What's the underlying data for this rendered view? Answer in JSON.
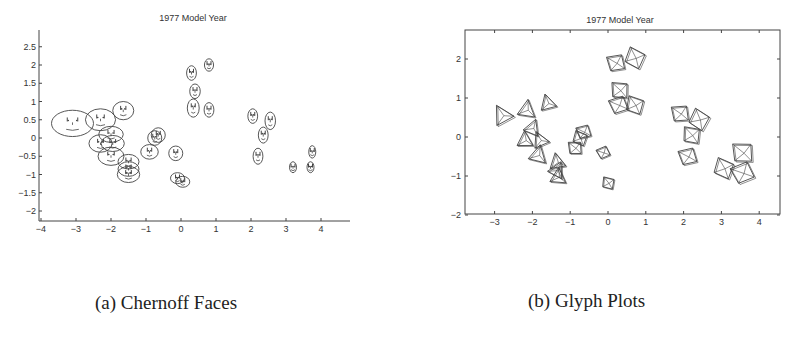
{
  "figure": {
    "captions": {
      "a": "(a) Chernoff Faces",
      "b": "(b) Glyph Plots"
    }
  },
  "chart_data": [
    {
      "type": "scatter",
      "glyph": "chernoff-face",
      "title": "1977 Model Year",
      "caption": "(a) Chernoff Faces",
      "xlabel": "",
      "ylabel": "",
      "xlim": [
        -4,
        4.8
      ],
      "ylim": [
        -2.3,
        3.0
      ],
      "xticks": [
        -4,
        -3,
        -2,
        -1,
        0,
        1,
        2,
        3,
        4
      ],
      "yticks": [
        2.5,
        2,
        1.5,
        1,
        0.5,
        0,
        -0.5,
        -1,
        -1.5,
        -2
      ],
      "grid": false,
      "box": false,
      "points": [
        {
          "x": -3.1,
          "y": 0.4,
          "w": 0.6,
          "h": 0.36
        },
        {
          "x": -2.3,
          "y": 0.5,
          "w": 0.43,
          "h": 0.3
        },
        {
          "x": -1.65,
          "y": 0.75,
          "w": 0.3,
          "h": 0.25
        },
        {
          "x": -2.0,
          "y": 0.1,
          "w": 0.35,
          "h": 0.22
        },
        {
          "x": -2.3,
          "y": -0.15,
          "w": 0.33,
          "h": 0.24
        },
        {
          "x": -1.95,
          "y": -0.15,
          "w": 0.33,
          "h": 0.22
        },
        {
          "x": -2.0,
          "y": -0.5,
          "w": 0.37,
          "h": 0.25
        },
        {
          "x": -1.5,
          "y": -0.65,
          "w": 0.3,
          "h": 0.2
        },
        {
          "x": -1.5,
          "y": -0.85,
          "w": 0.3,
          "h": 0.2
        },
        {
          "x": -1.5,
          "y": -1.0,
          "w": 0.32,
          "h": 0.22
        },
        {
          "x": -0.65,
          "y": 0.08,
          "w": 0.2,
          "h": 0.2
        },
        {
          "x": -0.75,
          "y": 0.0,
          "w": 0.2,
          "h": 0.2
        },
        {
          "x": -0.9,
          "y": -0.38,
          "w": 0.25,
          "h": 0.2
        },
        {
          "x": -0.15,
          "y": -0.42,
          "w": 0.2,
          "h": 0.2
        },
        {
          "x": -0.1,
          "y": -1.1,
          "w": 0.2,
          "h": 0.15
        },
        {
          "x": 0.05,
          "y": -1.2,
          "w": 0.2,
          "h": 0.15
        },
        {
          "x": 0.3,
          "y": 1.78,
          "w": 0.14,
          "h": 0.2
        },
        {
          "x": 0.8,
          "y": 2.0,
          "w": 0.13,
          "h": 0.17
        },
        {
          "x": 0.4,
          "y": 1.28,
          "w": 0.15,
          "h": 0.2
        },
        {
          "x": 0.35,
          "y": 0.82,
          "w": 0.17,
          "h": 0.25
        },
        {
          "x": 0.8,
          "y": 0.77,
          "w": 0.14,
          "h": 0.2
        },
        {
          "x": 2.05,
          "y": 0.6,
          "w": 0.14,
          "h": 0.2
        },
        {
          "x": 2.55,
          "y": 0.47,
          "w": 0.15,
          "h": 0.24
        },
        {
          "x": 2.35,
          "y": 0.08,
          "w": 0.14,
          "h": 0.22
        },
        {
          "x": 2.2,
          "y": -0.5,
          "w": 0.14,
          "h": 0.22
        },
        {
          "x": 3.2,
          "y": -0.8,
          "w": 0.1,
          "h": 0.15
        },
        {
          "x": 3.75,
          "y": -0.38,
          "w": 0.1,
          "h": 0.17
        },
        {
          "x": 3.7,
          "y": -0.8,
          "w": 0.1,
          "h": 0.15
        }
      ]
    },
    {
      "type": "scatter",
      "glyph": "pyramid-star",
      "title": "1977 Model Year",
      "caption": "(b) Glyph Plots",
      "xlabel": "",
      "ylabel": "",
      "xlim": [
        -3.8,
        4.5
      ],
      "ylim": [
        -2,
        2.75
      ],
      "xticks": [
        -3,
        -2,
        -1,
        0,
        1,
        2,
        3,
        4
      ],
      "yticks": [
        2,
        1,
        0,
        -1,
        -2
      ],
      "grid": false,
      "box": true,
      "points": [
        {
          "x": -2.8,
          "y": 0.56,
          "s": 0.55
        },
        {
          "x": -2.15,
          "y": 0.7,
          "s": 0.5
        },
        {
          "x": -1.6,
          "y": 0.87,
          "s": 0.45
        },
        {
          "x": -2.0,
          "y": 0.23,
          "s": 0.45
        },
        {
          "x": -2.2,
          "y": -0.08,
          "s": 0.45
        },
        {
          "x": -1.8,
          "y": -0.08,
          "s": 0.45
        },
        {
          "x": -1.85,
          "y": -0.46,
          "s": 0.5
        },
        {
          "x": -1.35,
          "y": -0.64,
          "s": 0.45
        },
        {
          "x": -1.35,
          "y": -0.85,
          "s": 0.45
        },
        {
          "x": -1.32,
          "y": -1.02,
          "s": 0.45
        },
        {
          "x": -0.65,
          "y": 0.13,
          "s": 0.4
        },
        {
          "x": -0.75,
          "y": -0.03,
          "s": 0.4
        },
        {
          "x": -0.88,
          "y": -0.28,
          "s": 0.4
        },
        {
          "x": -0.13,
          "y": -0.4,
          "s": 0.35
        },
        {
          "x": 0.0,
          "y": -1.18,
          "s": 0.35
        },
        {
          "x": 0.2,
          "y": 1.9,
          "s": 0.5
        },
        {
          "x": 0.7,
          "y": 2.03,
          "s": 0.55
        },
        {
          "x": 0.3,
          "y": 1.2,
          "s": 0.5
        },
        {
          "x": 0.27,
          "y": 0.82,
          "s": 0.5
        },
        {
          "x": 0.7,
          "y": 0.82,
          "s": 0.5
        },
        {
          "x": 1.9,
          "y": 0.6,
          "s": 0.5
        },
        {
          "x": 2.4,
          "y": 0.45,
          "s": 0.55
        },
        {
          "x": 2.2,
          "y": 0.05,
          "s": 0.5
        },
        {
          "x": 2.1,
          "y": -0.5,
          "s": 0.5
        },
        {
          "x": 3.05,
          "y": -0.8,
          "s": 0.55
        },
        {
          "x": 3.55,
          "y": -0.4,
          "s": 0.6
        },
        {
          "x": 3.55,
          "y": -0.92,
          "s": 0.6
        }
      ]
    }
  ]
}
